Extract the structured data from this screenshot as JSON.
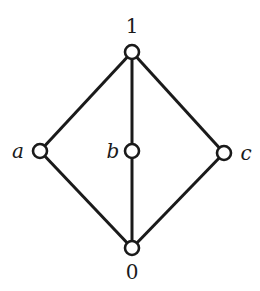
{
  "diagram": {
    "type": "hasse-diagram",
    "nodes": [
      {
        "id": "top",
        "label": "1",
        "x": 132,
        "y": 52,
        "lx": 132,
        "ly": 33
      },
      {
        "id": "a",
        "label": "a",
        "x": 40,
        "y": 151,
        "lx": 18,
        "ly": 158
      },
      {
        "id": "b",
        "label": "b",
        "x": 132,
        "y": 151,
        "lx": 113,
        "ly": 158
      },
      {
        "id": "c",
        "label": "c",
        "x": 224,
        "y": 153,
        "lx": 246,
        "ly": 160
      },
      {
        "id": "bottom",
        "label": "0",
        "x": 132,
        "y": 248,
        "lx": 132,
        "ly": 279
      }
    ],
    "edges": [
      [
        "top",
        "a"
      ],
      [
        "top",
        "b"
      ],
      [
        "top",
        "c"
      ],
      [
        "a",
        "bottom"
      ],
      [
        "b",
        "bottom"
      ],
      [
        "c",
        "bottom"
      ]
    ]
  }
}
